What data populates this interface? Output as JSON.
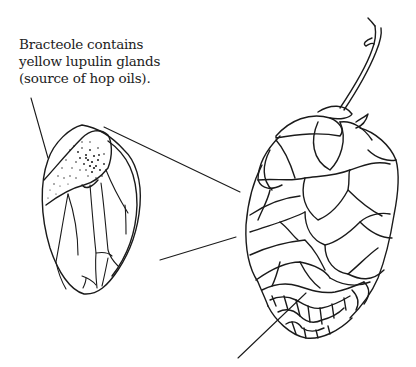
{
  "figure": {
    "annotation": {
      "lines": [
        "Bracteole contains",
        "yellow lupulin glands",
        "(source of hop oils)."
      ]
    },
    "parts": [
      {
        "name": "bracteole",
        "description": "enlarged single bracteole with stippled lupulin gland region"
      },
      {
        "name": "hop-cone",
        "description": "whole hop cone with overlapping bracts and stem"
      },
      {
        "name": "zoom-lines",
        "description": "two lines connecting bracteole to cone"
      },
      {
        "name": "pointer-line",
        "description": "leader line from label to bracteole"
      },
      {
        "name": "strig-pointer",
        "description": "line pointing into the cone base"
      }
    ],
    "colors": {
      "ink": "#1a1a1a",
      "background": "#ffffff"
    }
  }
}
